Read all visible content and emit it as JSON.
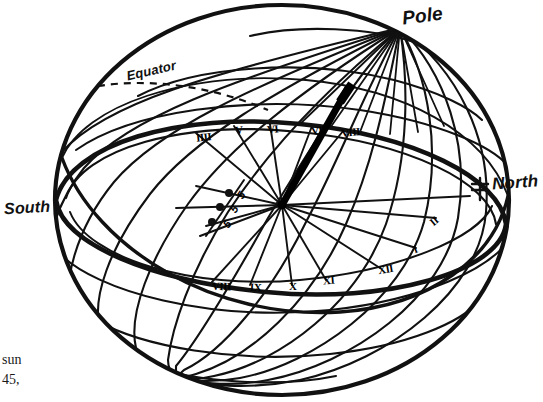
{
  "figure": {
    "ink_color": "#111111",
    "background_color": "#ffffff",
    "labels": {
      "pole": "Pole",
      "north": "North",
      "south": "South",
      "equator": "Equator"
    },
    "hour_numerals_upper": [
      {
        "text": "IIII",
        "x": 196,
        "y": 131
      },
      {
        "text": "V",
        "x": 235,
        "y": 124
      },
      {
        "text": "VI",
        "x": 267,
        "y": 123
      },
      {
        "text": "VII",
        "x": 311,
        "y": 124
      },
      {
        "text": "VIII",
        "x": 341,
        "y": 126
      }
    ],
    "hour_numerals_lower": [
      {
        "text": "VIII",
        "x": 212,
        "y": 280
      },
      {
        "text": "IX",
        "x": 250,
        "y": 281
      },
      {
        "text": "X",
        "x": 289,
        "y": 280
      },
      {
        "text": "XI",
        "x": 323,
        "y": 274
      },
      {
        "text": "XII",
        "x": 378,
        "y": 263
      },
      {
        "text": "I",
        "x": 413,
        "y": 243
      },
      {
        "text": "II",
        "x": 430,
        "y": 215
      }
    ],
    "tick_markers": [
      {
        "text": "5",
        "x": 238,
        "y": 189,
        "dot_x": 229,
        "dot_y": 193
      },
      {
        "text": "5",
        "x": 231,
        "y": 203,
        "dot_x": 220,
        "dot_y": 207
      },
      {
        "text": "5",
        "x": 224,
        "y": 218,
        "dot_x": 213,
        "dot_y": 222
      }
    ],
    "gnomon": {
      "from_x": 282,
      "from_y": 205,
      "to_x": 348,
      "to_y": 88
    },
    "sphere": {
      "cx": 282,
      "cy": 200,
      "rx": 228,
      "ry": 196
    },
    "caption_lines": [
      "sun",
      "45,"
    ]
  }
}
